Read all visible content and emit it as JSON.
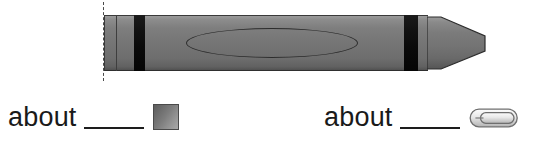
{
  "worksheet": {
    "name": "measurement-estimation-worksheet",
    "background_color": "#ffffff"
  },
  "figure": {
    "name": "crayon-illustration",
    "object": "crayon",
    "measure_line_label": "measurement start line",
    "body_color": "#757575",
    "band_color": "#0d0d0d",
    "outline_color": "#2c2c2c",
    "label_oval_text": ""
  },
  "prompts": [
    {
      "id": "prompt-swatch",
      "label": "about",
      "blank_value": "",
      "blank_placeholder": "",
      "unit_icon": "color-swatch-icon",
      "unit_name": "color square",
      "unit_color_start": "#5d5d5d",
      "unit_color_end": "#a8a8a8"
    },
    {
      "id": "prompt-paperclip",
      "label": "about",
      "blank_value": "",
      "blank_placeholder": "",
      "unit_icon": "paperclip-icon",
      "unit_name": "paper clip",
      "unit_color_start": "#ffffff",
      "unit_color_end": "#8c8c8c"
    }
  ],
  "colors": {
    "text": "#1a1a1a",
    "rule": "#1d1d1d",
    "dashed_guide": "#4a4a4a"
  }
}
